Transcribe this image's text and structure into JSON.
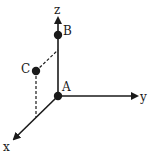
{
  "diagram": {
    "type": "3d-coordinate-axes",
    "colors": {
      "line": "#1a1a1a",
      "background": "#ffffff"
    },
    "axes": [
      {
        "name": "z",
        "label": "z",
        "direction": "up"
      },
      {
        "name": "y",
        "label": "y",
        "direction": "right"
      },
      {
        "name": "x",
        "label": "x",
        "direction": "down-left"
      }
    ],
    "points": [
      {
        "name": "A",
        "label": "A",
        "position": "origin"
      },
      {
        "name": "B",
        "label": "B",
        "position": "on z-axis"
      },
      {
        "name": "C",
        "label": "C",
        "position": "in xz-plane"
      }
    ],
    "projections": [
      {
        "from": "C",
        "to": "z-axis",
        "style": "dashed"
      },
      {
        "from": "C",
        "to": "x-axis",
        "style": "dashed"
      }
    ]
  }
}
